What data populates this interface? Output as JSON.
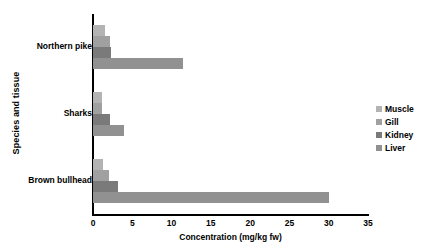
{
  "chart_data": {
    "type": "bar",
    "orientation": "horizontal",
    "title": "",
    "xlabel": "Concentration (mg/kg fw)",
    "ylabel": "Species and tissue",
    "categories": [
      "Northern pike",
      "Sharks",
      "Brown bullhead"
    ],
    "series": [
      {
        "name": "Muscle",
        "color": "#b3b3b3",
        "values": [
          1.5,
          1.2,
          1.3
        ]
      },
      {
        "name": "Gill",
        "color": "#a0a0a0",
        "values": [
          2.2,
          1.1,
          2.0
        ]
      },
      {
        "name": "Kidney",
        "color": "#7a7a7a",
        "values": [
          2.3,
          2.2,
          3.2
        ]
      },
      {
        "name": "Liver",
        "color": "#919191",
        "values": [
          11.4,
          4.0,
          30.0
        ]
      }
    ],
    "xlim": [
      0,
      35
    ],
    "xticks": [
      0,
      5,
      10,
      15,
      20,
      25,
      30,
      35
    ],
    "xtick_labels": [
      "0",
      "5",
      "10",
      "15",
      "20",
      "25",
      "30",
      "35"
    ],
    "grid": false,
    "legend_position": "right"
  },
  "legend": {
    "items": [
      {
        "label": "Muscle"
      },
      {
        "label": "Gill"
      },
      {
        "label": "Kidney"
      },
      {
        "label": "Liver"
      }
    ]
  }
}
